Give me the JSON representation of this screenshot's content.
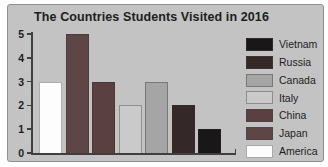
{
  "chart_data": {
    "type": "bar",
    "title": "The Countries Students Visited in 2016",
    "categories": [
      "America",
      "Japan",
      "China",
      "Italy",
      "Canada",
      "Russia",
      "Vietnam"
    ],
    "values": [
      3,
      5,
      3,
      2,
      3,
      2,
      1
    ],
    "xlabel": "",
    "ylabel": "",
    "ylim": [
      0,
      5
    ],
    "yticks": [
      0,
      1,
      2,
      3,
      4,
      5
    ],
    "grid": false,
    "legend_position": "right",
    "legend": [
      {
        "label": "Vietnam",
        "color": "#191717"
      },
      {
        "label": "Russia",
        "color": "#342828"
      },
      {
        "label": "Canada",
        "color": "#a5a5a5"
      },
      {
        "label": "Italy",
        "color": "#cacaca"
      },
      {
        "label": "China",
        "color": "#5a4040"
      },
      {
        "label": "Japan",
        "color": "#5f4646"
      },
      {
        "label": "America",
        "color": "#fdfdfd"
      }
    ]
  },
  "colors": {
    "panel_bg": "#c3c3c3",
    "panel_border": "#8f8f8f",
    "axis": "#3f3f3f",
    "text": "#1d1d1d",
    "figure_bg": "#fefefe"
  }
}
